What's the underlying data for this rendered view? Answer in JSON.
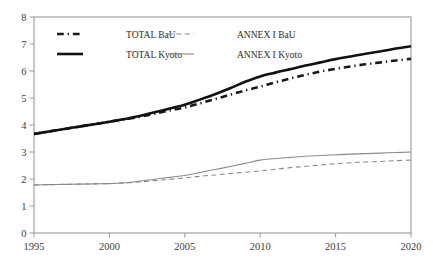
{
  "chart_data": {
    "type": "line",
    "title": "",
    "xlabel": "",
    "ylabel": "",
    "xlim": [
      1995,
      2020
    ],
    "ylim": [
      0,
      8
    ],
    "grid": false,
    "legend_position": "top-left-inside",
    "xticks": [
      1995,
      2000,
      2005,
      2010,
      2015,
      2020
    ],
    "yticks": [
      0,
      1,
      2,
      3,
      4,
      5,
      6,
      7,
      8
    ],
    "x": [
      1995,
      1996,
      1997,
      1998,
      1999,
      2000,
      2001,
      2002,
      2003,
      2004,
      2005,
      2006,
      2007,
      2008,
      2009,
      2010,
      2011,
      2012,
      2013,
      2014,
      2015,
      2016,
      2017,
      2018,
      2019,
      2020
    ],
    "series": [
      {
        "name": "TOTAL BaU",
        "style": "dash-dot",
        "color": "#1a1a1a",
        "width": 2.6,
        "values": [
          3.67,
          3.76,
          3.85,
          3.94,
          4.03,
          4.12,
          4.21,
          4.3,
          4.42,
          4.54,
          4.65,
          4.8,
          4.96,
          5.12,
          5.28,
          5.42,
          5.58,
          5.72,
          5.86,
          5.98,
          6.08,
          6.17,
          6.25,
          6.32,
          6.39,
          6.45
        ]
      },
      {
        "name": "TOTAL Kyoto",
        "style": "solid",
        "color": "#111111",
        "width": 2.6,
        "values": [
          3.67,
          3.76,
          3.85,
          3.94,
          4.03,
          4.12,
          4.22,
          4.33,
          4.47,
          4.61,
          4.75,
          4.94,
          5.14,
          5.36,
          5.6,
          5.8,
          5.94,
          6.07,
          6.2,
          6.32,
          6.44,
          6.54,
          6.64,
          6.73,
          6.83,
          6.92
        ]
      },
      {
        "name": "ANNEX I BaU",
        "style": "dashed",
        "color": "#8a8a8a",
        "width": 1.1,
        "values": [
          1.78,
          1.79,
          1.8,
          1.81,
          1.82,
          1.83,
          1.85,
          1.89,
          1.94,
          1.99,
          2.04,
          2.1,
          2.15,
          2.2,
          2.25,
          2.3,
          2.36,
          2.42,
          2.47,
          2.52,
          2.57,
          2.6,
          2.63,
          2.65,
          2.68,
          2.7
        ]
      },
      {
        "name": "ANNEX I Kyoto",
        "style": "solid",
        "color": "#8a8a8a",
        "width": 1.1,
        "values": [
          1.78,
          1.79,
          1.8,
          1.81,
          1.82,
          1.83,
          1.86,
          1.92,
          1.99,
          2.06,
          2.13,
          2.24,
          2.35,
          2.46,
          2.58,
          2.7,
          2.76,
          2.8,
          2.84,
          2.87,
          2.9,
          2.92,
          2.94,
          2.96,
          2.98,
          3.0
        ]
      }
    ]
  },
  "axis": {
    "y_labels": [
      "8",
      "7",
      "6",
      "5",
      "4",
      "3",
      "2",
      "1",
      "0"
    ],
    "x_labels": [
      "1995",
      "2000",
      "2005",
      "2010",
      "2015",
      "2020"
    ]
  },
  "legend": {
    "entries": [
      {
        "label": "TOTAL BaU",
        "style": "dash-dot",
        "color": "#1a1a1a"
      },
      {
        "label": "ANNEX I BaU",
        "style": "dashed",
        "color": "#8a8a8a"
      },
      {
        "label": "TOTAL Kyoto",
        "style": "solid",
        "color": "#111111"
      },
      {
        "label": "ANNEX I Kyoto",
        "style": "solid",
        "color": "#8a8a8a"
      }
    ]
  }
}
